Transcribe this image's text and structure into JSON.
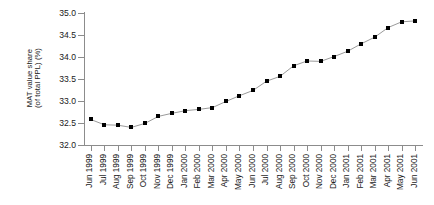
{
  "chart_data": {
    "type": "line",
    "title": "",
    "xlabel": "",
    "ylabel": "MAT value share (of total PPL) (%)",
    "ylabel_lines": [
      "MAT value share",
      "(of total PPL) (%)"
    ],
    "ylim": [
      32.0,
      35.0
    ],
    "ytick_step": 0.5,
    "ytick_labels": [
      "32.0",
      "32.5",
      "33.0",
      "33.5",
      "34.0",
      "34.5",
      "35.0"
    ],
    "ytick_values": [
      32.0,
      32.5,
      33.0,
      33.5,
      34.0,
      34.5,
      35.0
    ],
    "grid": false,
    "legend": false,
    "marker": "square",
    "marker_color": "#000000",
    "line_color": "#9a9a9a",
    "axis_color": "#8c8c8c",
    "categories": [
      "Jun 1999",
      "Jul 1999",
      "Aug 1999",
      "Sep 1999",
      "Oct 1999",
      "Nov 1999",
      "Dec 1999",
      "Jan 2000",
      "Feb 2000",
      "Mar 2000",
      "Apr 2000",
      "May 2000",
      "Jun 2000",
      "Jul 2000",
      "Aug 2000",
      "Sep 2000",
      "Oct 2000",
      "Nov 2000",
      "Dec 2000",
      "Jan 2001",
      "Feb 2001",
      "Mar 2001",
      "Apr 2001",
      "May 2001",
      "Jun 2001"
    ],
    "values": [
      32.58,
      32.46,
      32.45,
      32.4,
      32.49,
      32.65,
      32.72,
      32.78,
      32.81,
      32.85,
      32.99,
      33.12,
      33.24,
      33.45,
      33.56,
      33.8,
      33.91,
      33.9,
      34.01,
      34.13,
      34.3,
      34.45,
      34.67,
      34.8,
      34.82
    ]
  }
}
